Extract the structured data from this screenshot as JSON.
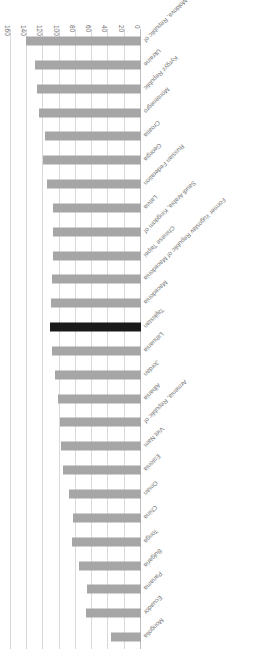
{
  "chart_data": {
    "type": "bar",
    "orientation": "horizontal",
    "title": "",
    "subtitle": "",
    "xlabel": "",
    "ylabel": "",
    "xlim": [
      0,
      160
    ],
    "xticks": [
      0,
      20,
      40,
      60,
      80,
      100,
      120,
      140,
      160
    ],
    "xtick_labels": [
      "0",
      "20",
      "40",
      "60",
      "80",
      "100",
      "120",
      "140",
      "160"
    ],
    "grid": true,
    "legend": false,
    "rotated_180": true,
    "bar_color": "#a6a6a6",
    "highlight_color": "#1a1a1a",
    "highlight_category": "Tajikistan",
    "categories": [
      "Mongolia",
      "Ecuador",
      "Panama",
      "Bulgaria",
      "Tonga",
      "China",
      "Oman",
      "Estonia",
      "Viet Nam",
      "Armenia, Republic of",
      "Albania",
      "Jordan",
      "Lithuania",
      "Tajikistan",
      "Macedonia",
      "Former Yugoslav Republic of Macedonia",
      "Chinese Taipei",
      "Saudi Arabia, Kingdom of",
      "Latvia",
      "Russian Federation",
      "Georgia",
      "Croatia",
      "Montenegro",
      "Kyrgyz Republic",
      "Ukraine",
      "Moldova, Republic of"
    ],
    "values": [
      37,
      68,
      67,
      76,
      85,
      84,
      89,
      96,
      99,
      100,
      102,
      106,
      110,
      112,
      111,
      109,
      108,
      108,
      108,
      116,
      120,
      118,
      125,
      128,
      130,
      141
    ]
  }
}
